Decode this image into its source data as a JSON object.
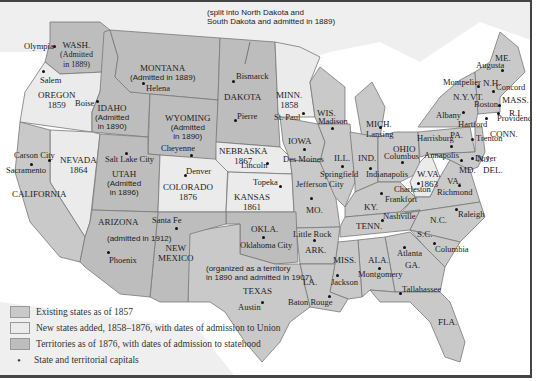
{
  "colors": {
    "existing": "#c9c9c9",
    "new_states": "#ebebeb",
    "territories": "#bdbdbd",
    "water": "#ffffff",
    "foreign": "#efefef",
    "border": "#777777"
  },
  "legend": [
    {
      "key": "existing",
      "label": "Existing states as of 1857"
    },
    {
      "key": "new_states",
      "label": "New states added, 1858–1876, with dates of admission to Union"
    },
    {
      "key": "territories",
      "label": "Territories as of 1876, with dates of admission to statehood"
    },
    {
      "key": "capital",
      "label": "State and territorial capitals"
    }
  ],
  "states": [
    {
      "id": "wash",
      "name": "WASH.",
      "note": "(Admitted in 1889)"
    },
    {
      "id": "oregon",
      "name": "OREGON",
      "note": "1859"
    },
    {
      "id": "idaho",
      "name": "IDAHO",
      "note": "(Admitted in 1890)"
    },
    {
      "id": "montana",
      "name": "MONTANA",
      "note": "(Admitted in 1889)"
    },
    {
      "id": "wyoming",
      "name": "WYOMING",
      "note": "(Admitted in 1890)"
    },
    {
      "id": "dakota",
      "name": "DAKOTA",
      "note": "(split into North Dakota and South Dakota and admitted in 1889)"
    },
    {
      "id": "minn",
      "name": "MINN.",
      "note": "1858"
    },
    {
      "id": "wis",
      "name": "WIS.",
      "note": ""
    },
    {
      "id": "mich",
      "name": "MICH.",
      "note": ""
    },
    {
      "id": "nevada",
      "name": "NEVADA",
      "note": "1864"
    },
    {
      "id": "california",
      "name": "CALIFORNIA",
      "note": ""
    },
    {
      "id": "utah",
      "name": "UTAH",
      "note": "(Admitted in 1896)"
    },
    {
      "id": "colorado",
      "name": "COLORADO",
      "note": "1876"
    },
    {
      "id": "nebraska",
      "name": "NEBRASKA",
      "note": "1867"
    },
    {
      "id": "kansas",
      "name": "KANSAS",
      "note": "1861"
    },
    {
      "id": "iowa",
      "name": "IOWA",
      "note": ""
    },
    {
      "id": "ill",
      "name": "ILL.",
      "note": ""
    },
    {
      "id": "ind",
      "name": "IND.",
      "note": ""
    },
    {
      "id": "ohio",
      "name": "OHIO",
      "note": ""
    },
    {
      "id": "mo",
      "name": "MO.",
      "note": ""
    },
    {
      "id": "ky",
      "name": "KY.",
      "note": ""
    },
    {
      "id": "wva",
      "name": "W.VA.",
      "note": "1863"
    },
    {
      "id": "va",
      "name": "VA.",
      "note": ""
    },
    {
      "id": "pa",
      "name": "PA.",
      "note": ""
    },
    {
      "id": "ny",
      "name": "N.Y.",
      "note": ""
    },
    {
      "id": "vt",
      "name": "VT.",
      "note": ""
    },
    {
      "id": "nh",
      "name": "N.H.",
      "note": ""
    },
    {
      "id": "me",
      "name": "ME.",
      "note": ""
    },
    {
      "id": "mass",
      "name": "MASS.",
      "note": ""
    },
    {
      "id": "ri",
      "name": "R.I.",
      "note": ""
    },
    {
      "id": "conn",
      "name": "CONN.",
      "note": ""
    },
    {
      "id": "nj",
      "name": "N.J.",
      "note": ""
    },
    {
      "id": "del",
      "name": "DEL.",
      "note": ""
    },
    {
      "id": "md",
      "name": "MD.",
      "note": ""
    },
    {
      "id": "arizona",
      "name": "ARIZONA",
      "note": "(admitted in 1912)"
    },
    {
      "id": "newmexico",
      "name": "NEW MEXICO",
      "note": ""
    },
    {
      "id": "okla",
      "name": "OKLA.",
      "note": "(organized as a territory in 1890 and admitted in 1907)"
    },
    {
      "id": "texas",
      "name": "TEXAS",
      "note": ""
    },
    {
      "id": "ark",
      "name": "ARK.",
      "note": ""
    },
    {
      "id": "la",
      "name": "LA.",
      "note": ""
    },
    {
      "id": "miss",
      "name": "MISS.",
      "note": ""
    },
    {
      "id": "ala",
      "name": "ALA.",
      "note": ""
    },
    {
      "id": "ga",
      "name": "GA.",
      "note": ""
    },
    {
      "id": "fla",
      "name": "FLA.",
      "note": ""
    },
    {
      "id": "tenn",
      "name": "TENN.",
      "note": ""
    },
    {
      "id": "nc",
      "name": "N.C.",
      "note": ""
    },
    {
      "id": "sc",
      "name": "S.C.",
      "note": ""
    }
  ],
  "capitals": [
    "Olympia",
    "Salem",
    "Boise",
    "Helena",
    "Bismarck",
    "Pierre",
    "St. Paul",
    "Madison",
    "Lansing",
    "Carson City",
    "Sacramento",
    "Salt Lake City",
    "Cheyenne",
    "Denver",
    "Lincoln",
    "Topeka",
    "Des Moines",
    "Springfield",
    "Indianapolis",
    "Columbus",
    "Jefferson City",
    "Frankfort",
    "Charleston",
    "Richmond",
    "Harrisburg",
    "Annapolis",
    "Dover",
    "Trenton",
    "Albany",
    "Hartford",
    "Providence",
    "Boston",
    "Concord",
    "Montpelier",
    "Augusta",
    "Santa Fe",
    "Phoenix",
    "Oklahoma City",
    "Austin",
    "Little Rock",
    "Baton Rouge",
    "Jackson",
    "Montgomery",
    "Atlanta",
    "Tallahassee",
    "Nashville",
    "Raleigh",
    "Columbia"
  ]
}
